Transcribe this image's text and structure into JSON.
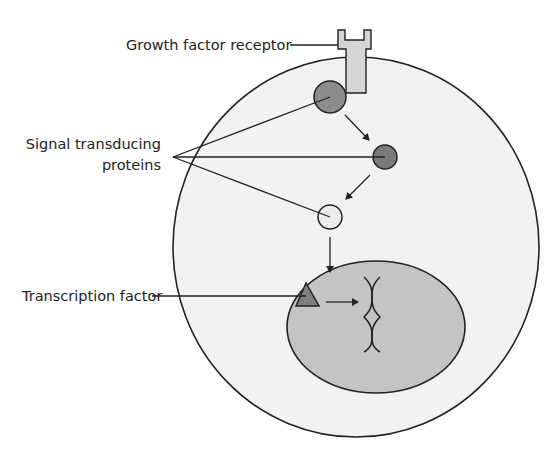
{
  "diagram": {
    "type": "cell signaling pathway",
    "labels": {
      "receptor": "Growth factor receptor",
      "signal_line1": "Signal transducing",
      "signal_line2": "proteins",
      "transcription": "Transcription factor"
    },
    "colors": {
      "cell_fill": "#f2f2f2",
      "nucleus_fill": "#c4c4c4",
      "receptor_fill": "#d4d4d4",
      "protein1_fill": "#8c8c8c",
      "protein2_fill": "#7a7a7a",
      "protein3_fill": "#ececec",
      "tf_fill": "#7f7f7f",
      "stroke": "#222222"
    }
  }
}
